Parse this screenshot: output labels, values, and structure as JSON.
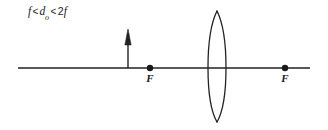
{
  "diagram": {
    "condition_label": {
      "f_symbol": "f",
      "relation_1": "<",
      "object_distance_symbol": "d",
      "object_distance_subscript": "o",
      "relation_2": "<",
      "two_f_coefficient": "2",
      "two_f_symbol": "f",
      "full_text": "f < do < 2f"
    },
    "optical_axis": {
      "name": "optical-axis",
      "x_start": 18,
      "x_end": 310,
      "y": 68,
      "stroke_width": 1.4
    },
    "lens": {
      "name": "converging-lens",
      "type": "biconvex",
      "center_x": 217,
      "center_y": 68,
      "top_apex_y": 11,
      "bottom_apex_y": 122,
      "half_width": 9,
      "stroke_width": 1.3
    },
    "object_arrow": {
      "name": "object-arrow",
      "x": 128,
      "base_y": 68,
      "tip_y": 31,
      "head_length": 13,
      "head_half_width": 3,
      "stroke_width": 1.4
    },
    "focal_points": [
      {
        "name": "focal-point-left",
        "label": "F",
        "x": 150,
        "y": 68,
        "radius": 3.2
      },
      {
        "name": "focal-point-right",
        "label": "F",
        "x": 285,
        "y": 68,
        "radius": 3.2
      }
    ],
    "colors": {
      "background": "#ffffff",
      "ink": "#1a1a1a",
      "line": "#222222"
    }
  }
}
